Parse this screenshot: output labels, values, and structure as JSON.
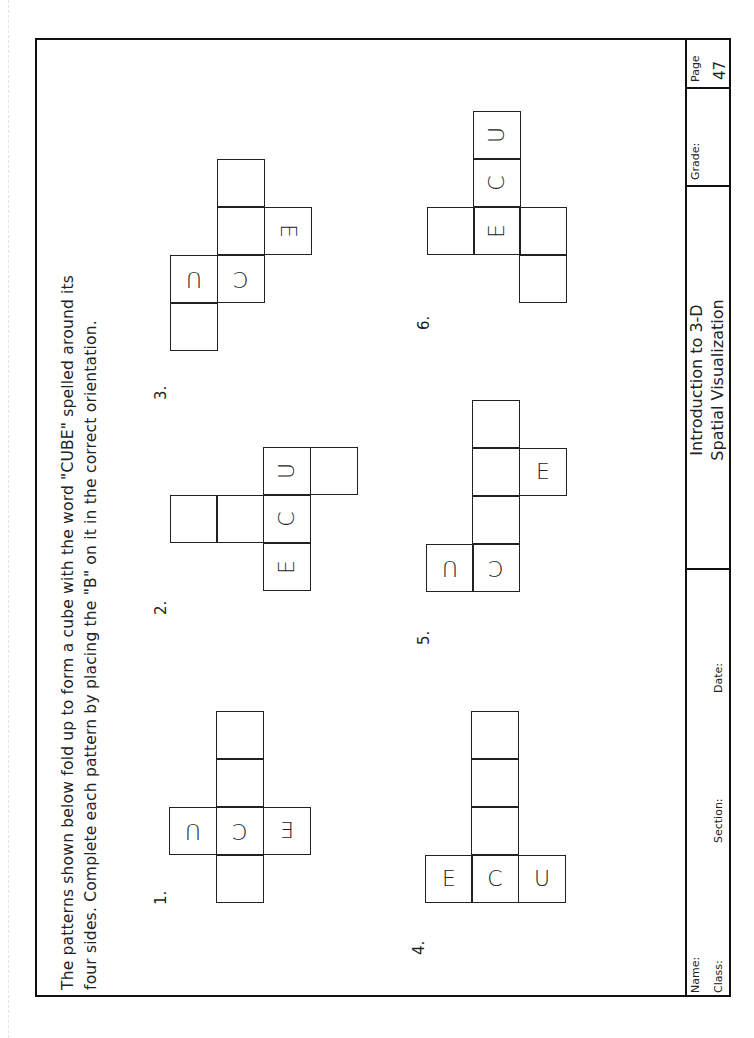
{
  "instructions": {
    "line1": "The patterns shown below fold up to form a cube with the word \"CUBE\" spelled around its",
    "line2": "four sides.  Complete each pattern by placing the \"B\" on it in the correct orientation."
  },
  "title_block": {
    "name_label": "Name:",
    "class_label": "Class:",
    "section_label": "Section:",
    "date_label": "Date:",
    "title_line1": "Introduction to 3-D",
    "title_line2": "Spatial Visualization",
    "grade_label": "Grade:",
    "page_label": "Page",
    "page_number": "47"
  },
  "patterns": [
    {
      "number": "1.",
      "letters": {
        "u": "U",
        "c": "C",
        "e": "E"
      }
    },
    {
      "number": "2.",
      "letters": {
        "u": "U",
        "c": "C",
        "e": "E"
      }
    },
    {
      "number": "3.",
      "letters": {
        "u": "U",
        "c": "C",
        "e": "E"
      }
    },
    {
      "number": "4.",
      "letters": {
        "u": "U",
        "c": "C",
        "e": "E"
      }
    },
    {
      "number": "5.",
      "letters": {
        "u": "U",
        "c": "C",
        "e": "E"
      }
    },
    {
      "number": "6.",
      "letters": {
        "u": "U",
        "c": "C",
        "e": "E"
      }
    }
  ]
}
